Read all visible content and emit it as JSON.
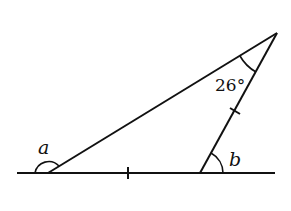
{
  "diagram": {
    "type": "triangle-exterior-angles",
    "labels": {
      "angle_a": "a",
      "angle_b": "b",
      "apex_angle": "26°"
    },
    "geometry": {
      "baseline": {
        "x1": 17,
        "y1": 173,
        "x2": 275,
        "y2": 173
      },
      "vertices": {
        "left": {
          "x": 48,
          "y": 173
        },
        "right": {
          "x": 200,
          "y": 173
        },
        "apex": {
          "x": 277,
          "y": 33
        }
      },
      "equal_side_ticks": [
        "base: left-right",
        "side: right-apex"
      ]
    },
    "colors": {
      "stroke": "#111111",
      "background": "#ffffff"
    }
  }
}
